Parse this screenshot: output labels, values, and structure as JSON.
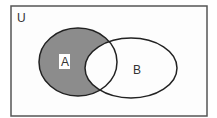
{
  "diagram": {
    "type": "venn",
    "universe_label": "U",
    "sets": [
      {
        "name": "A",
        "label": "A"
      },
      {
        "name": "B",
        "label": "B"
      }
    ],
    "shaded_region": "A minus B",
    "colors": {
      "shade": "#8c8c8c",
      "stroke": "#222222",
      "border": "#555555",
      "background": "#ffffff"
    }
  }
}
